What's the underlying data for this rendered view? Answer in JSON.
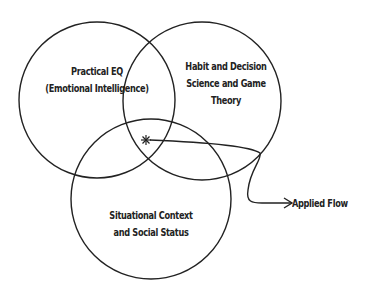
{
  "diagram": {
    "type": "venn",
    "stroke_color": "#222222",
    "background": "#ffffff",
    "circles": [
      {
        "id": "practical-eq",
        "lines": [
          "Practical EQ",
          "(Emotional Intelligence)"
        ],
        "cx": 97,
        "cy": 100,
        "r": 78
      },
      {
        "id": "habit-decision",
        "lines": [
          "Habit and Decision",
          "Science and Game",
          "Theory"
        ],
        "cx": 202,
        "cy": 101,
        "r": 79
      },
      {
        "id": "situational-context",
        "lines": [
          "Situational Context",
          "and Social Status"
        ],
        "cx": 151,
        "cy": 199,
        "r": 80
      }
    ],
    "intersection_marker": {
      "symbol": "✱",
      "x": 146,
      "y": 140
    },
    "callout": {
      "label": "Applied Flow"
    }
  }
}
